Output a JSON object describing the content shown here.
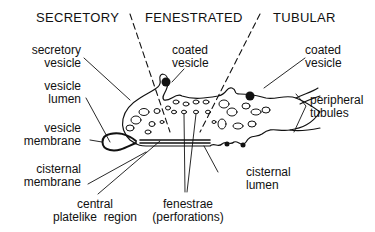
{
  "regions": {
    "secretory": "SECRETORY",
    "fenestrated": "FENESTRATED",
    "tubular": "TUBULAR"
  },
  "labels": {
    "secretory_vesicle": [
      "secretory",
      "vesicle"
    ],
    "vesicle_lumen": [
      "vesicle",
      "lumen"
    ],
    "vesicle_membrane": [
      "vesicle",
      "membrane"
    ],
    "cisternal_membrane": [
      "cisternal",
      "membrane"
    ],
    "central_platelike_region": [
      "central",
      "platelike  region"
    ],
    "fenestrae": [
      "fenestrae",
      "(perforations)"
    ],
    "cisternal_lumen": [
      "cisternal",
      "lumen"
    ],
    "coated_vesicle_center": [
      "coated",
      "vesicle"
    ],
    "coated_vesicle_right": [
      "coated",
      "vesicle"
    ],
    "peripheral_tubules": [
      "peripheral",
      "tubules"
    ]
  }
}
